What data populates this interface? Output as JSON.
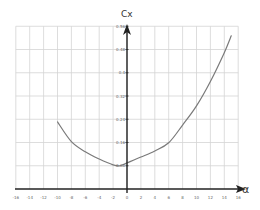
{
  "chart_data": {
    "type": "line",
    "title": "",
    "xlabel": "α",
    "ylabel": "Cx",
    "xlim": [
      -16,
      16
    ],
    "ylim": [
      0,
      0.56
    ],
    "grid": true,
    "legend": null,
    "x_ticks": [
      -16,
      -14,
      -12,
      -10,
      -8,
      -6,
      -4,
      -2,
      0,
      2,
      4,
      6,
      8,
      10,
      12,
      14,
      16
    ],
    "y_ticks": [
      0.08,
      0.16,
      0.24,
      0.32,
      0.4,
      0.48,
      0.56
    ],
    "x_tick_labels": [
      "-16",
      "-14",
      "-12",
      "-10",
      "-8",
      "-6",
      "-4",
      "-2",
      "0",
      "2",
      "4",
      "6",
      "8",
      "10",
      "12",
      "14",
      "16"
    ],
    "y_tick_labels": [
      "0.08",
      "0.16",
      "0.24",
      "0.32",
      "0.4",
      "0.48",
      "0.56"
    ],
    "series": [
      {
        "name": "Cx(α)",
        "color": "#7a7a7a",
        "x": [
          -10,
          -8,
          -6,
          -4,
          -2,
          -1,
          0,
          2,
          4,
          6,
          8,
          10,
          12,
          14,
          15
        ],
        "y": [
          0.231,
          0.163,
          0.128,
          0.103,
          0.083,
          0.08,
          0.09,
          0.11,
          0.131,
          0.159,
          0.22,
          0.286,
          0.37,
          0.469,
          0.527
        ]
      }
    ]
  },
  "labels": {
    "y_axis_title": "Cx",
    "x_axis_title": "α"
  },
  "colors": {
    "grid": "#d4d4d4",
    "axis": "#222222",
    "curve": "#7a7a7a"
  }
}
